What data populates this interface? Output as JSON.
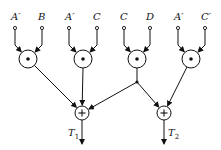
{
  "diagram": {
    "type": "logic-network",
    "colors": {
      "stroke": "#111111",
      "background": "#ffffff"
    },
    "inputs": [
      {
        "label": "A′",
        "x": 15,
        "gate": 0
      },
      {
        "label": "B",
        "x": 42,
        "gate": 0
      },
      {
        "label": "A′",
        "x": 69,
        "gate": 1
      },
      {
        "label": "C",
        "x": 97,
        "gate": 1
      },
      {
        "label": "C",
        "x": 124,
        "gate": 2
      },
      {
        "label": "D",
        "x": 150,
        "gate": 2
      },
      {
        "label": "A′",
        "x": 178,
        "gate": 3
      },
      {
        "label": "C′",
        "x": 205,
        "gate": 3
      }
    ],
    "and_gates": [
      {
        "symbol": "•",
        "cx": 28,
        "cy": 59
      },
      {
        "symbol": "•",
        "cx": 83,
        "cy": 59
      },
      {
        "symbol": "•",
        "cx": 137,
        "cy": 59
      },
      {
        "symbol": "•",
        "cx": 191,
        "cy": 59
      }
    ],
    "or_gates": [
      {
        "symbol": "+",
        "cx": 82,
        "cy": 113
      },
      {
        "symbol": "+",
        "cx": 164,
        "cy": 113
      }
    ],
    "junction": {
      "cx": 137,
      "cy": 82
    },
    "outputs": [
      {
        "label": "T",
        "sub": "1",
        "x": 82
      },
      {
        "label": "T",
        "sub": "2",
        "x": 164
      }
    ]
  }
}
